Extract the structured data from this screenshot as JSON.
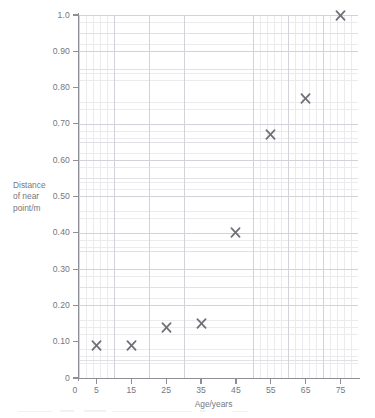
{
  "chart_data": {
    "type": "scatter",
    "title": "",
    "xlabel": "Age/years",
    "ylabel": "Distance of near point/m",
    "ylabel_lines": [
      "Distance",
      "of near",
      "point/m"
    ],
    "x": [
      5,
      15,
      25,
      35,
      45,
      55,
      65,
      75
    ],
    "values": [
      0.09,
      0.09,
      0.14,
      0.15,
      0.4,
      0.67,
      0.77,
      1.0
    ],
    "points": [
      {
        "x": 5,
        "y": 0.09
      },
      {
        "x": 15,
        "y": 0.09
      },
      {
        "x": 25,
        "y": 0.14
      },
      {
        "x": 35,
        "y": 0.15
      },
      {
        "x": 45,
        "y": 0.4
      },
      {
        "x": 55,
        "y": 0.67
      },
      {
        "x": 65,
        "y": 0.77
      },
      {
        "x": 75,
        "y": 1.0
      }
    ],
    "xlim": [
      0,
      80
    ],
    "ylim": [
      0,
      1.0
    ],
    "xticks": [
      0,
      5,
      15,
      25,
      35,
      45,
      55,
      65,
      75
    ],
    "xtick_labels": [
      "0",
      "5",
      "15",
      "25",
      "35",
      "45",
      "55",
      "65",
      "75"
    ],
    "yticks": [
      0,
      0.1,
      0.2,
      0.3,
      0.4,
      0.5,
      0.6,
      0.7,
      0.8,
      0.9,
      1.0
    ],
    "ytick_labels": [
      "0",
      "0.10",
      "0.20",
      "0.30",
      "0.40",
      "0.50",
      "0.60",
      "0.70",
      "0.80",
      "0.90",
      "1.0"
    ],
    "grid": true,
    "grid_minor": true,
    "legend": null,
    "marker": "x-cross",
    "marker_color": "#6e6e76",
    "grid_color": "#d2d2d8",
    "axis_color": "#8e8e96",
    "text_color": "#76767e",
    "background": "#ffffff"
  }
}
